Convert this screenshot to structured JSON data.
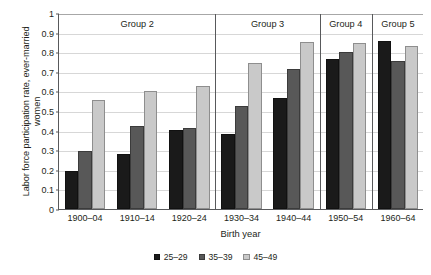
{
  "chart_data": {
    "type": "bar",
    "title": "",
    "xlabel": "Birth year",
    "ylabel": "Labor force participation rate, ever-married women",
    "ylim": [
      0,
      1
    ],
    "ytick_labels": [
      "0",
      "0.1",
      "0.2",
      "0.3",
      "0.4",
      "0.5",
      "0.6",
      "0.7",
      "0.8",
      "0.9",
      "1"
    ],
    "ytick_values": [
      0,
      0.1,
      0.2,
      0.3,
      0.4,
      0.5,
      0.6,
      0.7,
      0.8,
      0.9,
      1
    ],
    "grid": true,
    "legend_position": "bottom-center",
    "categories": [
      "1900–04",
      "1910–14",
      "1920–24",
      "1930–34",
      "1940–44",
      "1950–54",
      "1960–64"
    ],
    "series": [
      {
        "name": "25–29",
        "color": "#1a1a1a",
        "values": [
          0.195,
          0.28,
          0.405,
          0.385,
          0.565,
          0.765,
          0.855
        ]
      },
      {
        "name": "35–39",
        "color": "#585858",
        "values": [
          0.295,
          0.425,
          0.415,
          0.525,
          0.715,
          0.8,
          0.755
        ]
      },
      {
        "name": "45–49",
        "color": "#c9c9c9",
        "values": [
          0.555,
          0.6,
          0.63,
          0.745,
          0.85,
          0.845,
          0.83
        ]
      }
    ],
    "groups": [
      {
        "label": "Group 2",
        "categories": [
          "1900–04",
          "1910–14",
          "1920–24"
        ]
      },
      {
        "label": "Group 3",
        "categories": [
          "1930–34",
          "1940–44"
        ]
      },
      {
        "label": "Group 4",
        "categories": [
          "1950–54"
        ]
      },
      {
        "label": "Group 5",
        "categories": [
          "1960–64"
        ]
      }
    ]
  }
}
